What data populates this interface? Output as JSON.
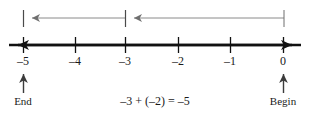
{
  "figure": {
    "background_color": "#ffffff",
    "axis_color": "#111111",
    "jump_arrow_color": "#8a8a8a",
    "marker_arrow_color": "#3b3b3b",
    "text_color": "#1a1a1a"
  },
  "number_line": {
    "axis_y": 45,
    "left_arrow_x": 8,
    "right_arrow_x": 302,
    "ticks": [
      {
        "label": "–5",
        "value": -5,
        "x": 23
      },
      {
        "label": "–4",
        "value": -4,
        "x": 75
      },
      {
        "label": "–3",
        "value": -3,
        "x": 125
      },
      {
        "label": "–2",
        "value": -2,
        "x": 178
      },
      {
        "label": "–1",
        "value": -1,
        "x": 230
      },
      {
        "label": "0",
        "value": 0,
        "x": 283
      }
    ],
    "tick_label_y": 54
  },
  "jumps": [
    {
      "name": "first-jump",
      "description": "jump of −3 from 0 to −3",
      "from_x": 284,
      "to_x": 126,
      "y": 18,
      "direction": "left"
    },
    {
      "name": "second-jump",
      "description": "jump of −2 from −3 to −5",
      "from_x": 125,
      "to_x": 24,
      "y": 18,
      "direction": "left"
    }
  ],
  "jump_endpoints": [
    {
      "name": "jump-endpoint-begin",
      "x": 284,
      "y_top": 10,
      "y_bottom": 27
    },
    {
      "name": "jump-endpoint-middle",
      "x": 125,
      "y_top": 10,
      "y_bottom": 27
    },
    {
      "name": "jump-endpoint-end",
      "x": 23,
      "y_top": 10,
      "y_bottom": 27
    }
  ],
  "markers": [
    {
      "name": "end-marker",
      "label": "End",
      "x": 23,
      "arrow_top_y": 70,
      "arrow_bottom_y": 93,
      "label_y": 96
    },
    {
      "name": "begin-marker",
      "label": "Begin",
      "x": 283,
      "arrow_top_y": 70,
      "arrow_bottom_y": 93,
      "label_y": 96
    }
  ],
  "equation": {
    "text": "–3 + (–2) = –5",
    "x": 155,
    "y": 96
  }
}
